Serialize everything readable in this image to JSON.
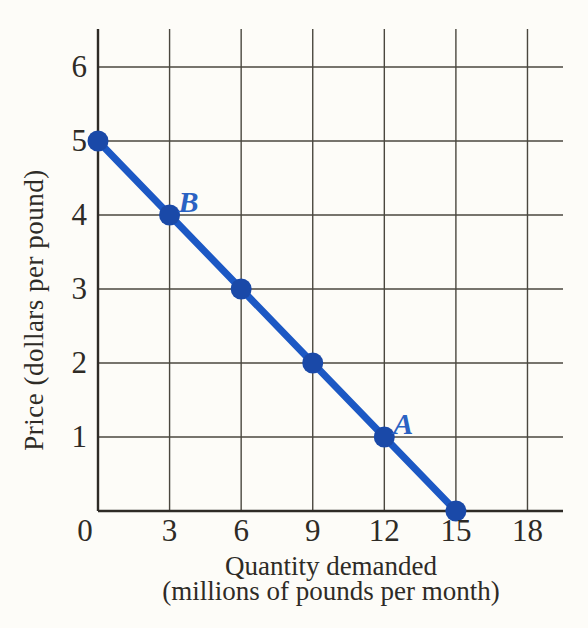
{
  "chart_data": {
    "type": "line",
    "title": "",
    "ylabel": "Price (dollars per pound)",
    "xlabel_line1": "Quantity demanded",
    "xlabel_line2": "(millions of pounds per month)",
    "x": [
      0,
      3,
      6,
      9,
      12,
      15
    ],
    "y": [
      5,
      4,
      3,
      2,
      1,
      0
    ],
    "x_ticks": [
      0,
      3,
      6,
      9,
      12,
      15,
      18
    ],
    "y_ticks": [
      1,
      2,
      3,
      4,
      5,
      6
    ],
    "xlim": [
      0,
      19.5
    ],
    "ylim": [
      0,
      6.5
    ],
    "grid": true,
    "legend": false,
    "line_color": "#1c58c4",
    "marker_color": "#1a49a8",
    "point_label_color": "#2a62c3",
    "ink_color": "#2e2b26",
    "grid_color": "#4a473f",
    "point_labels": [
      {
        "text": "B",
        "x": 3,
        "y": 4
      },
      {
        "text": "A",
        "x": 12,
        "y": 1
      }
    ]
  }
}
